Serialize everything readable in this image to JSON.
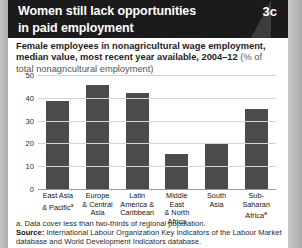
{
  "header": {
    "title_line1": "Women still lack opportunities",
    "title_line2": "in paid employment",
    "badge": "3c"
  },
  "subtitle": {
    "main": "Female employees in nonagricultural wage employment, median value, most recent year available, 2004–12 ",
    "unit": "(% of total nonagricultural employment)"
  },
  "notes": {
    "footnote_a": "a. Data cover less than two-thirds of regional population.",
    "source_label": "Source:",
    "source_text": " International Labour Organization Key Indicators of the Labour Market database and World Development Indicators database."
  },
  "chart_data": {
    "type": "bar",
    "title": "Women still lack opportunities in paid employment",
    "subtitle": "Female employees in nonagricultural wage employment, median value, most recent year available, 2004–12 (% of total nonagricultural employment)",
    "xlabel": "",
    "ylabel": "",
    "ylim": [
      0,
      50
    ],
    "yticks": [
      0,
      10,
      20,
      30,
      40,
      50
    ],
    "grid": true,
    "legend": "none",
    "bar_color": "#4b4b4b",
    "categories": [
      "East Asia & Pacific",
      "Europe & Central Asia",
      "Latin America & Caribbean",
      "Middle East & North Africa",
      "South Asia",
      "Sub-Saharan Africa"
    ],
    "category_labels": [
      {
        "lines": [
          "East Asia",
          "& Pacific"
        ],
        "superscript": "a"
      },
      {
        "lines": [
          "Europe",
          "& Central",
          "Asia"
        ],
        "superscript": ""
      },
      {
        "lines": [
          "Latin",
          "America &",
          "Caribbean"
        ],
        "superscript": ""
      },
      {
        "lines": [
          "Middle East",
          "& North",
          "Africa"
        ],
        "superscript": ""
      },
      {
        "lines": [
          "South",
          "Asia"
        ],
        "superscript": ""
      },
      {
        "lines": [
          "Sub-Saharan",
          "Africa"
        ],
        "superscript": "a"
      }
    ],
    "values": [
      39,
      46,
      42.5,
      16,
      20.5,
      35.5
    ]
  }
}
